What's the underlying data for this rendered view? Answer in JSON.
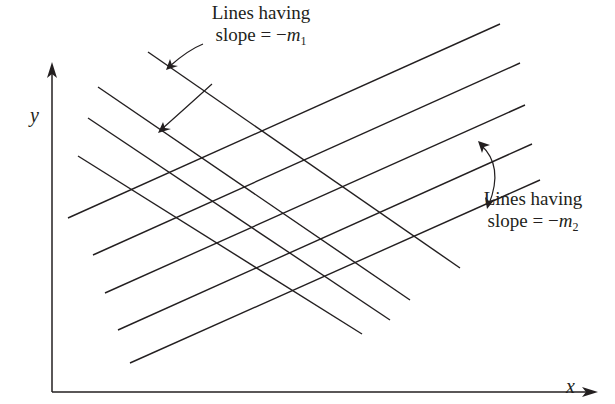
{
  "diagram": {
    "type": "family of intersecting straight lines on x-y axes",
    "colors": {
      "line": "#231f20",
      "background": "#ffffff"
    },
    "axes": {
      "x_label": "x",
      "y_label": "y"
    },
    "annotations": {
      "top": {
        "line1": "Lines having",
        "line2_prefix": "slope = −",
        "var": "m",
        "sub": "1"
      },
      "right": {
        "line1": "Lines having",
        "line2_prefix": "slope = −",
        "var": "m",
        "sub": "2"
      }
    },
    "family_1": {
      "name": "Lines having slope = −m1 (falling left-to-right)",
      "count": 4,
      "lines": [
        {
          "x1": 148,
          "y1": 52,
          "x2": 460,
          "y2": 268
        },
        {
          "x1": 98,
          "y1": 87,
          "x2": 410,
          "y2": 300
        },
        {
          "x1": 88,
          "y1": 118,
          "x2": 390,
          "y2": 320
        },
        {
          "x1": 78,
          "y1": 156,
          "x2": 362,
          "y2": 334
        }
      ]
    },
    "family_2": {
      "name": "Lines having slope = −m2 (rising left-to-right)",
      "count": 5,
      "lines": [
        {
          "x1": 68,
          "y1": 218,
          "x2": 500,
          "y2": 24
        },
        {
          "x1": 93,
          "y1": 255,
          "x2": 520,
          "y2": 63
        },
        {
          "x1": 105,
          "y1": 293,
          "x2": 525,
          "y2": 105
        },
        {
          "x1": 118,
          "y1": 330,
          "x2": 532,
          "y2": 144
        },
        {
          "x1": 130,
          "y1": 363,
          "x2": 540,
          "y2": 180
        }
      ]
    }
  }
}
